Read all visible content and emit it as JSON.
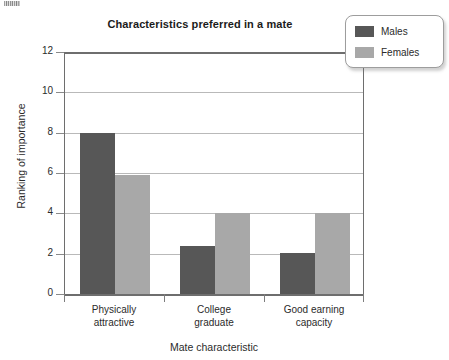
{
  "chart_data": {
    "type": "bar",
    "title": "Characteristics preferred in a mate",
    "xlabel": "Mate characteristic",
    "ylabel": "Ranking of importance",
    "categories": [
      "Physically attractive",
      "College graduate",
      "Good earning capacity"
    ],
    "category_lines": [
      [
        "Physically",
        "attractive"
      ],
      [
        "College",
        "graduate"
      ],
      [
        "Good earning",
        "capacity"
      ]
    ],
    "series": [
      {
        "name": "Males",
        "values": [
          8.0,
          2.4,
          2.05
        ],
        "color": "#575757"
      },
      {
        "name": "Females",
        "values": [
          5.9,
          4.0,
          4.0
        ],
        "color": "#a8a8a8"
      }
    ],
    "ylim": [
      0,
      12
    ],
    "yticks": [
      0,
      2,
      4,
      6,
      8,
      10,
      12
    ],
    "ytick_labels": [
      "0",
      "2",
      "4",
      "6",
      "8",
      "10",
      "12"
    ],
    "grid": true,
    "grid_axis": "y",
    "legend_position": "top-right",
    "bar_style": "grouped"
  },
  "legend": {
    "entries": [
      {
        "label": "Males",
        "color": "#575757"
      },
      {
        "label": "Females",
        "color": "#a8a8a8"
      }
    ]
  },
  "colors": {
    "males": "#575757",
    "females": "#a8a8a8",
    "gridline": "#b9b9b9",
    "axis": "#6e6e6e",
    "text": "#2b2b2b",
    "background": "#ffffff"
  }
}
